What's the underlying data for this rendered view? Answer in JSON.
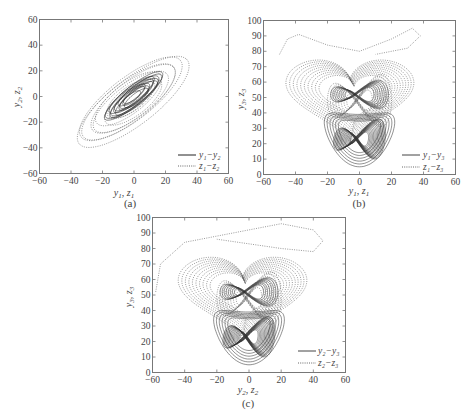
{
  "chart_data": [
    {
      "id": "a",
      "type": "line",
      "caption": "(a)",
      "xlabel": "y1, z1",
      "ylabel": "y2, z2",
      "xlim": [
        -60,
        60
      ],
      "ylim": [
        -60,
        60
      ],
      "xticks": [
        -60,
        -40,
        -20,
        0,
        20,
        40,
        60
      ],
      "yticks": [
        -60,
        -40,
        -20,
        0,
        20,
        40,
        60
      ],
      "grid": false,
      "legend_position": "lower right",
      "series": [
        {
          "name": "y1−y2",
          "style": "solid",
          "color": "#222222",
          "shape": "diagonal-ellipses",
          "extent": [
            -25,
            25
          ]
        },
        {
          "name": "z1−z2",
          "style": "dotted",
          "color": "#555555",
          "shape": "diagonal-ellipses",
          "extent": [
            -50,
            45
          ]
        }
      ]
    },
    {
      "id": "b",
      "type": "line",
      "caption": "(b)",
      "xlabel": "y1, z1",
      "ylabel": "y3, z3",
      "xlim": [
        -60,
        60
      ],
      "ylim": [
        0,
        100
      ],
      "xticks": [
        -60,
        -40,
        -20,
        0,
        20,
        40,
        60
      ],
      "yticks": [
        0,
        10,
        20,
        30,
        40,
        50,
        60,
        70,
        80,
        90,
        100
      ],
      "grid": false,
      "legend_position": "lower right",
      "series": [
        {
          "name": "y1−y3",
          "style": "solid",
          "color": "#333333",
          "shape": "lorenz-butterfly",
          "center": [
            0,
            25
          ]
        },
        {
          "name": "z1−z3",
          "style": "dotted",
          "color": "#555555",
          "shape": "heart-attractor",
          "top": 95
        }
      ]
    },
    {
      "id": "c",
      "type": "line",
      "caption": "(c)",
      "xlabel": "y2, z2",
      "ylabel": "y3, z3",
      "xlim": [
        -60,
        60
      ],
      "ylim": [
        0,
        100
      ],
      "xticks": [
        -60,
        -40,
        -20,
        0,
        20,
        40,
        60
      ],
      "yticks": [
        0,
        10,
        20,
        30,
        40,
        50,
        60,
        70,
        80,
        90,
        100
      ],
      "grid": false,
      "legend_position": "lower right",
      "series": [
        {
          "name": "y2−y3",
          "style": "solid",
          "color": "#333333",
          "shape": "lorenz-butterfly",
          "center": [
            0,
            25
          ]
        },
        {
          "name": "z2−z3",
          "style": "dotted",
          "color": "#555555",
          "shape": "heart-attractor",
          "top": 95
        }
      ]
    }
  ],
  "panels": {
    "a": {
      "caption": "(a)",
      "xlabel_main": "y",
      "xlabel_sub1": "1",
      "xlabel_sep": ", ",
      "xlabel_main2": "z",
      "xlabel_sub2": "1",
      "ylabel_main": "y",
      "ylabel_sub1": "2",
      "ylabel_main2": "z",
      "ylabel_sub2": "2",
      "legend1": "y₁−y₂",
      "legend2": "z₁−z₂"
    },
    "b": {
      "caption": "(b)",
      "xlabel_main": "y",
      "xlabel_sub1": "1",
      "xlabel_sep": ", ",
      "xlabel_main2": "z",
      "xlabel_sub2": "1",
      "ylabel_main": "y",
      "ylabel_sub1": "3",
      "ylabel_main2": "z",
      "ylabel_sub2": "3",
      "legend1": "y₁−y₃",
      "legend2": "z₁−z₃"
    },
    "c": {
      "caption": "(c)",
      "xlabel_main": "y",
      "xlabel_sub1": "2",
      "xlabel_sep": ", ",
      "xlabel_main2": "z",
      "xlabel_sub2": "2",
      "ylabel_main": "y",
      "ylabel_sub1": "3",
      "ylabel_main2": "z",
      "ylabel_sub2": "3",
      "legend1": "y₂−y₃",
      "legend2": "z₂−z₃"
    }
  }
}
